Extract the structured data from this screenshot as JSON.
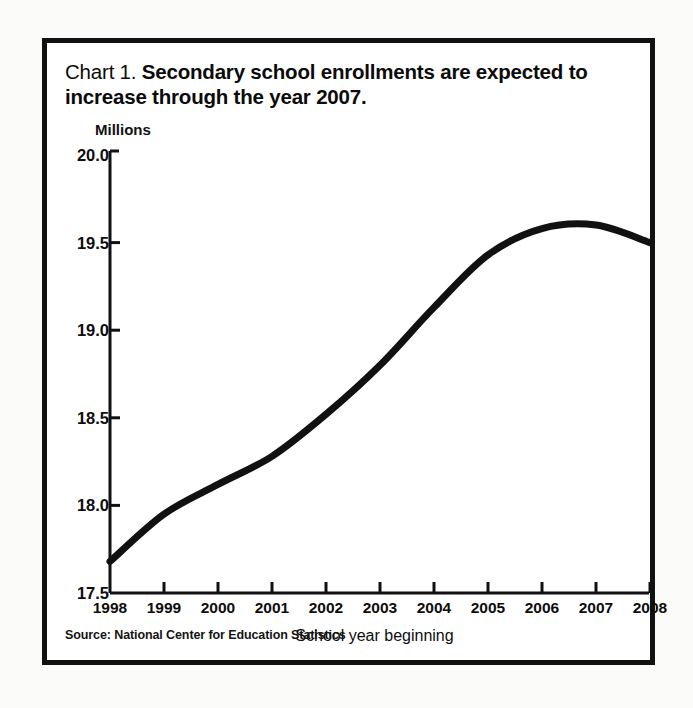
{
  "figure": {
    "title_prefix": "Chart 1.",
    "title_main": "Secondary school enrollments are expected to increase through the year 2007.",
    "source_note": "Source: National Center for Education Statistics"
  },
  "chart_data": {
    "type": "line",
    "title": "Chart 1. Secondary school enrollments are expected to increase through the year 2007.",
    "xlabel": "School year beginning",
    "ylabel": "Millions",
    "ylim": [
      17.5,
      20.0
    ],
    "xlim": [
      1998,
      2008
    ],
    "yticks": [
      "20.0",
      "19.5",
      "19.0",
      "18.5",
      "18.0",
      "17.5"
    ],
    "ytick_values": [
      20.0,
      19.5,
      19.0,
      18.5,
      18.0,
      17.5
    ],
    "xticks": [
      "1998",
      "1999",
      "2000",
      "2001",
      "2002",
      "2003",
      "2004",
      "2005",
      "2006",
      "2007",
      "2008"
    ],
    "x": [
      1998,
      1999,
      2000,
      2001,
      2002,
      2003,
      2004,
      2005,
      2006,
      2007,
      2008
    ],
    "values": [
      17.68,
      17.95,
      18.12,
      18.28,
      18.52,
      18.8,
      19.13,
      19.43,
      19.58,
      19.6,
      19.5
    ],
    "series": [
      {
        "name": "Secondary school enrollment",
        "values": [
          17.68,
          17.95,
          18.12,
          18.28,
          18.52,
          18.8,
          19.13,
          19.43,
          19.58,
          19.6,
          19.5
        ]
      }
    ],
    "grid": false,
    "legend": false,
    "line_color": "#111111",
    "line_width": 7,
    "smooth": true
  }
}
